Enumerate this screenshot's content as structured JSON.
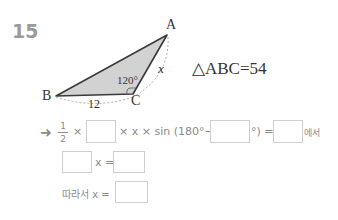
{
  "problem": {
    "number": "15",
    "figure": {
      "vertex_a": "A",
      "vertex_b": "B",
      "vertex_c": "C",
      "angle_c": "120°",
      "side_bc": "12",
      "side_ca": "x",
      "fill_color": "#d2d2d2"
    },
    "given": "△ABC=54"
  },
  "solution": {
    "arrow": "➜",
    "frac_num": "1",
    "frac_den": "2",
    "times1": "×",
    "mid_text": "× x × sin (",
    "angle_text": "180°−",
    "close_text": "°) =",
    "suffix": "에서",
    "row2_text": "x =",
    "row3_text": "따라서 x ="
  }
}
